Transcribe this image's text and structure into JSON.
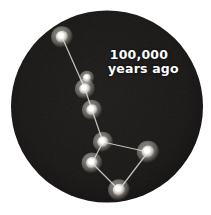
{
  "figure": {
    "name": "big-dipper-constellation-100000-years-ago",
    "caption_line_1": "100,000",
    "caption_line_2": "years ago",
    "colors": {
      "page_background": "#ffffff",
      "sky_disc": "#1c1a19",
      "sky_disc_edge": "#0d0c0c",
      "star_core": "#ffffff",
      "star_glow": "#e8e6e0",
      "link_line": "#cfcdc7",
      "caption_text": "#ffffff"
    },
    "disc": {
      "center_x": 107,
      "center_y": 106.5,
      "radius": 96
    }
  },
  "chart_data": {
    "type": "scatter",
    "title": "100,000 years ago",
    "xlabel": "",
    "ylabel": "",
    "grid": false,
    "legend": null,
    "xlim": [
      0,
      211
    ],
    "ylim": [
      0,
      215
    ],
    "annotations": [
      "100,000",
      "years ago"
    ],
    "stars": [
      {
        "id": "star-1",
        "x": 62,
        "y": 37,
        "r": 6.2,
        "label": ""
      },
      {
        "id": "star-2",
        "x": 87,
        "y": 78,
        "r": 4.2,
        "label": ""
      },
      {
        "id": "star-3",
        "x": 85,
        "y": 89,
        "r": 5.8,
        "label": ""
      },
      {
        "id": "star-4",
        "x": 92,
        "y": 110,
        "r": 5.8,
        "label": ""
      },
      {
        "id": "star-5",
        "x": 103,
        "y": 142,
        "r": 5.8,
        "label": ""
      },
      {
        "id": "star-6",
        "x": 92,
        "y": 163,
        "r": 6.0,
        "label": ""
      },
      {
        "id": "star-7",
        "x": 148,
        "y": 152,
        "r": 6.4,
        "label": ""
      },
      {
        "id": "star-8",
        "x": 119,
        "y": 190,
        "r": 6.2,
        "label": ""
      }
    ],
    "links": [
      {
        "from": "star-1",
        "to": "star-3"
      },
      {
        "from": "star-3",
        "to": "star-4"
      },
      {
        "from": "star-4",
        "to": "star-5"
      },
      {
        "from": "star-5",
        "to": "star-6"
      },
      {
        "from": "star-5",
        "to": "star-7"
      },
      {
        "from": "star-6",
        "to": "star-8"
      },
      {
        "from": "star-8",
        "to": "star-7"
      }
    ]
  }
}
